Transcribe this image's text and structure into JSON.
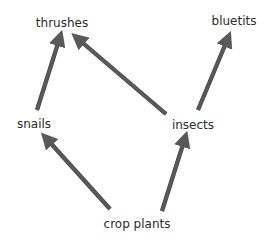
{
  "diagram": {
    "title": "",
    "type": "food-web",
    "nodes": [
      {
        "id": "thrushes",
        "label": "thrushes",
        "x": 62,
        "y": 16
      },
      {
        "id": "bluetits",
        "label": "bluetits",
        "x": 234,
        "y": 14
      },
      {
        "id": "snails",
        "label": "snails",
        "x": 34,
        "y": 117
      },
      {
        "id": "insects",
        "label": "insects",
        "x": 193,
        "y": 118
      },
      {
        "id": "crop_plants",
        "label": "crop plants",
        "x": 137,
        "y": 217
      }
    ],
    "edges": [
      {
        "from": "snails",
        "to": "thrushes",
        "x1": 37,
        "y1": 110,
        "x2": 60,
        "y2": 37
      },
      {
        "from": "insects",
        "to": "thrushes",
        "x1": 166,
        "y1": 114,
        "x2": 77,
        "y2": 38
      },
      {
        "from": "insects",
        "to": "bluetits",
        "x1": 198,
        "y1": 110,
        "x2": 228,
        "y2": 38
      },
      {
        "from": "crop_plants",
        "to": "snails",
        "x1": 110,
        "y1": 209,
        "x2": 46,
        "y2": 138
      },
      {
        "from": "crop_plants",
        "to": "insects",
        "x1": 162,
        "y1": 211,
        "x2": 185,
        "y2": 138
      }
    ],
    "colors": {
      "arrow": "#595959",
      "arrow_edge": "#3f3f3f",
      "text": "#2b2b2b",
      "background": "#ffffff"
    }
  }
}
